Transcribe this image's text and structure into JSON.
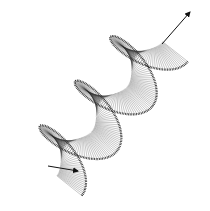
{
  "figure": {
    "background": "#ffffff",
    "stroke_color": "#2a2a2a",
    "arrow_color": "#111111"
  },
  "chart_data": {
    "type": "quiver-helix",
    "title": "",
    "xlabel": "",
    "ylabel": "",
    "grid": false,
    "legend": null,
    "helix": {
      "turns": 3,
      "axis_start": [
        52,
        172
      ],
      "axis_end": [
        158,
        38
      ],
      "radius_outer": 38,
      "radius_inner": 6,
      "segments_per_turn": 90
    },
    "arrows": [
      {
        "name": "axis-arrow-top",
        "from": [
          162,
          44
        ],
        "to": [
          190,
          12
        ]
      },
      {
        "name": "start-arrow-bottom",
        "from": [
          48,
          166
        ],
        "to": [
          78,
          171
        ]
      }
    ]
  }
}
